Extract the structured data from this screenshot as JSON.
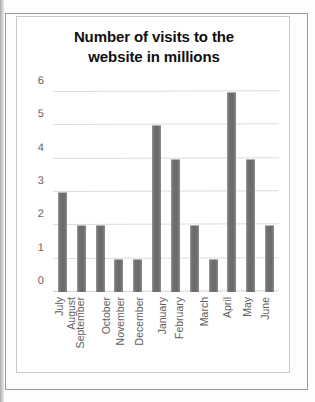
{
  "chart_data": {
    "type": "bar",
    "title": "Number of visits to the website in millions",
    "title_lines": [
      "Number of visits to the",
      "website in millions"
    ],
    "categories": [
      "July",
      "August",
      "September",
      "October",
      "November",
      "December",
      "January",
      "February",
      "March",
      "April",
      "May",
      "June"
    ],
    "values": [
      3,
      2,
      2,
      1,
      1,
      5,
      4,
      2,
      1,
      6,
      4,
      2
    ],
    "xlabel": "",
    "ylabel": "",
    "ylim": [
      0,
      6
    ],
    "yticks": [
      0,
      1,
      2,
      3,
      4,
      5,
      6
    ],
    "ytick_labels": [
      "0",
      "1",
      "2",
      "3",
      "4",
      "5",
      "6"
    ],
    "grid": true,
    "legend": false,
    "legend_position": "none",
    "bar_color": "#6f6f6f",
    "gridline_color": "#dcdcdc",
    "title_color": "#0f0f0f",
    "tick_label_color": "#666666",
    "x_label_rotation": -90
  }
}
